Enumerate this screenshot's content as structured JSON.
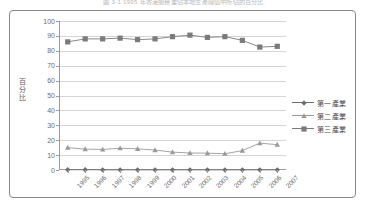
{
  "caption": "圖 3-1  1995 年香港服務業佔本地生產總值中所佔的百分比",
  "chart_data": {
    "type": "line",
    "title": "",
    "xlabel": "",
    "ylabel": "百分比",
    "ylim": [
      0,
      100
    ],
    "yticks": [
      0,
      10,
      20,
      30,
      40,
      50,
      60,
      70,
      80,
      90,
      100
    ],
    "grid": true,
    "legend_position": "right",
    "categories": [
      "1995",
      "1996",
      "1997",
      "1998",
      "1999",
      "2000",
      "2001",
      "2002",
      "2003",
      "2004",
      "2005",
      "2006",
      "2007"
    ],
    "series": [
      {
        "name": "第一產業",
        "marker": "diamond",
        "color": "#6f6f6f",
        "values": [
          0.2,
          0.2,
          0.1,
          0.1,
          0.1,
          0.1,
          0.1,
          0.1,
          0.1,
          0.1,
          0.1,
          0.1,
          0.1
        ]
      },
      {
        "name": "第二產業",
        "marker": "triangle",
        "color": "#9a9a9a",
        "values": [
          15.0,
          14.0,
          13.8,
          14.6,
          14.2,
          13.4,
          12.0,
          11.4,
          11.3,
          10.9,
          13.0,
          18.0,
          17.0
        ]
      },
      {
        "name": "第三產業",
        "marker": "square",
        "color": "#7b7b7b",
        "values": [
          86.0,
          88.0,
          88.0,
          88.5,
          87.5,
          88.0,
          89.5,
          90.5,
          89.0,
          89.5,
          87.0,
          82.5,
          83.0
        ]
      }
    ]
  },
  "legend": {
    "items": [
      {
        "label": "第一產業"
      },
      {
        "label": "第二產業"
      },
      {
        "label": "第三產業"
      }
    ]
  }
}
